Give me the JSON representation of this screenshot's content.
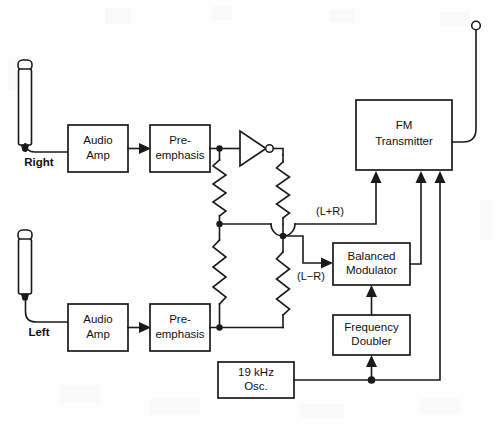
{
  "diagram": {
    "background_color": "#fefefe",
    "line_color": "#1a1a1a",
    "blocks": [
      {
        "id": "audio_amp_right",
        "label_line1": "Audio",
        "label_line2": "Amp"
      },
      {
        "id": "pre_emphasis_right",
        "label_line1": "Pre-",
        "label_line2": "emphasis"
      },
      {
        "id": "audio_amp_left",
        "label_line1": "Audio",
        "label_line2": "Amp"
      },
      {
        "id": "pre_emphasis_left",
        "label_line1": "Pre-",
        "label_line2": "emphasis"
      },
      {
        "id": "fm_transmitter",
        "label_line1": "FM",
        "label_line2": "Transmitter"
      },
      {
        "id": "balanced_modulator",
        "label_line1": "Balanced",
        "label_line2": "Modulator"
      },
      {
        "id": "frequency_doubler",
        "label_line1": "Frequency",
        "label_line2": "Doubler"
      },
      {
        "id": "osc_19khz",
        "label_line1": "19 kHz",
        "label_line2": "Osc."
      }
    ],
    "channel_labels": {
      "right": "Right",
      "left": "Left"
    },
    "signal_labels": {
      "sum": "(L+R)",
      "difference": "(L−R)"
    },
    "components": {
      "inverter": "inverter-gate",
      "microphone_right": "microphone-icon",
      "microphone_left": "microphone-icon",
      "antenna": "antenna-icon",
      "resistors": 4
    }
  }
}
